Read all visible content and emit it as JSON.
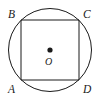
{
  "figure": {
    "type": "geometry-diagram",
    "background_color": "#ffffff",
    "stroke_color": "#1a1a1a",
    "label_color": "#1a1a1a",
    "canvas": {
      "width": 101,
      "height": 107
    },
    "circle": {
      "name": "circumscribed-circle",
      "center_x": 50,
      "center_y": 50,
      "radius": 41.5,
      "stroke_width": 1,
      "fill": "none"
    },
    "square": {
      "name": "inscribed-square",
      "stroke_width": 1,
      "fill": "none",
      "points": "21,20 79,20 79,80 21,80",
      "side_length": 58
    },
    "center_point": {
      "name": "center-dot",
      "cx": 50,
      "cy": 50,
      "r": 2.6,
      "fill": "#1a1a1a"
    },
    "labels": {
      "a": "A",
      "b": "B",
      "c": "C",
      "d": "D",
      "o": "O"
    }
  }
}
